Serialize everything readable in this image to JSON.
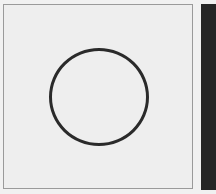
{
  "figure": {
    "shape": "circle",
    "stroke_color": "#2a2a2a",
    "background_color": "#eeeeee",
    "side_bar_color": "#262626"
  }
}
